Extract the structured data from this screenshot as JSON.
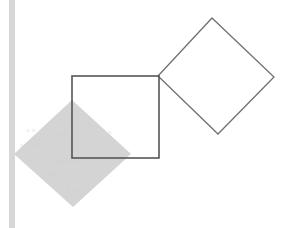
{
  "figure": {
    "canvas": {
      "width": 299,
      "height": 228,
      "background_color": "#ffffff"
    },
    "colors": {
      "background": "#ffffff",
      "stroke": "#555555",
      "shaded_fill": "#d4d4d4",
      "margin_strip": "#d7d7d7",
      "ghost_text": "#cfcfcf"
    },
    "shapes": {
      "margin_strip": {
        "label": "left-margin-scan-strip",
        "x": 9,
        "y": 0,
        "width": 6,
        "height": 228,
        "fill": "#d7d7d7"
      },
      "shaded_diamond": {
        "label": "shaded-rotated-square",
        "fill": "#d4d4d4",
        "points": "72,100 14,154 73,207 131,154",
        "vertices": [
          {
            "name": "top",
            "x": 72,
            "y": 100
          },
          {
            "name": "left",
            "x": 14,
            "y": 154
          },
          {
            "name": "bottom",
            "x": 73,
            "y": 207
          },
          {
            "name": "right",
            "x": 131,
            "y": 154
          }
        ]
      },
      "upright_square": {
        "label": "upright-square-outline",
        "stroke": "#555555",
        "stroke_width": 1.6,
        "fill": "none",
        "x": 72,
        "y": 76,
        "width": 87,
        "height": 82,
        "points": "72,76 159,76 159,158 72,158"
      },
      "rotated_square": {
        "label": "rotated-square-outline",
        "stroke": "#707070",
        "stroke_width": 1.3,
        "fill": "none",
        "points": "212,18 274,77 218,134 158,76",
        "vertices": [
          {
            "name": "top",
            "x": 212,
            "y": 18
          },
          {
            "name": "right",
            "x": 274,
            "y": 77
          },
          {
            "name": "bottom",
            "x": 218,
            "y": 134
          },
          {
            "name": "left",
            "x": 158,
            "y": 76
          }
        ]
      }
    },
    "ghost_text": [
      {
        "text": "a  n",
        "x": 26,
        "y": 126,
        "size": 7
      },
      {
        "text": "a t a",
        "x": 52,
        "y": 130,
        "size": 7
      },
      {
        "text": "n",
        "x": 108,
        "y": 128,
        "size": 7
      },
      {
        "text": "o   i n  i",
        "x": 20,
        "y": 141,
        "size": 7
      },
      {
        "text": "t",
        "x": 96,
        "y": 143,
        "size": 7
      },
      {
        "text": "n  o",
        "x": 26,
        "y": 155,
        "size": 7
      },
      {
        "text": "o  n  t  n",
        "x": 56,
        "y": 157,
        "size": 7
      },
      {
        "text": "a n",
        "x": 46,
        "y": 170,
        "size": 7
      },
      {
        "text": "1 2 3",
        "x": 66,
        "y": 186,
        "size": 7
      }
    ]
  }
}
